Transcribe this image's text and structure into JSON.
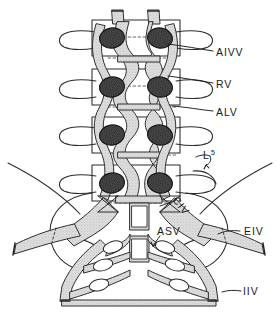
{
  "figure": {
    "style": "line-art anatomical illustration, anterior view",
    "colors": {
      "background": "#ffffff",
      "ink": "#1a1a1a",
      "vessel_fill": "#d8d8d8",
      "vessel_stipple": "#b0b0b0",
      "foramen_fill": "#3a3a3a",
      "bone_outline": "#2b2b2b"
    },
    "labels": [
      {
        "id": "aivv",
        "text": "AIVV",
        "meaning": "anterior internal vertebral vein",
        "x": 216,
        "y": 54,
        "leader_from": [
          213,
          51
        ],
        "leader_to": [
          168,
          44
        ]
      },
      {
        "id": "rv",
        "text": "RV",
        "meaning": "radicular vein",
        "x": 216,
        "y": 86,
        "leader_from": [
          213,
          83
        ],
        "leader_to": [
          168,
          76
        ]
      },
      {
        "id": "alv",
        "text": "ALV",
        "meaning": "ascending lumbar vein",
        "x": 216,
        "y": 114,
        "leader_from": [
          213,
          111
        ],
        "leader_to": [
          172,
          106
        ]
      },
      {
        "id": "l5",
        "text": "L",
        "subscript": "5",
        "meaning": "fifth lumbar vertebra",
        "x": 204,
        "y": 158
      },
      {
        "id": "civ",
        "text": "CIV",
        "meaning": "common iliac vein",
        "x": 172,
        "y": 200,
        "rotation": 52
      },
      {
        "id": "asv",
        "text": "ASV",
        "meaning": "anterior sacral vein",
        "x": 157,
        "y": 234
      },
      {
        "id": "eiv",
        "text": "EIV",
        "meaning": "external iliac vein",
        "x": 244,
        "y": 233
      },
      {
        "id": "iiv",
        "text": "IIV",
        "meaning": "internal iliac vein",
        "x": 243,
        "y": 293
      }
    ],
    "anatomy": {
      "vertebral_levels": 4,
      "foramina_per_level": 2,
      "foramina_count": 8,
      "transverse_processes_per_side": 4,
      "cut_vessel_stumps_top": 2,
      "sacral_foramina_rows": 3
    }
  }
}
